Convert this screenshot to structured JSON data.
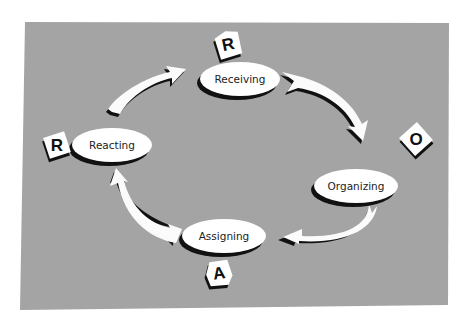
{
  "diagram": {
    "type": "cycle",
    "colors": {
      "panel": "#a4a4a4",
      "node_fill": "#ffffff",
      "shadow": "#111111",
      "arrow_fill": "#fbfbfb"
    },
    "nodes": [
      {
        "id": "receiving",
        "label": "Receiving",
        "tile": "R"
      },
      {
        "id": "organizing",
        "label": "Organizing",
        "tile": "O"
      },
      {
        "id": "assigning",
        "label": "Assigning",
        "tile": "A"
      },
      {
        "id": "reacting",
        "label": "Reacting",
        "tile": "R"
      }
    ],
    "edges": [
      {
        "from": "receiving",
        "to": "organizing"
      },
      {
        "from": "organizing",
        "to": "assigning"
      },
      {
        "from": "assigning",
        "to": "reacting"
      },
      {
        "from": "reacting",
        "to": "receiving"
      }
    ]
  }
}
